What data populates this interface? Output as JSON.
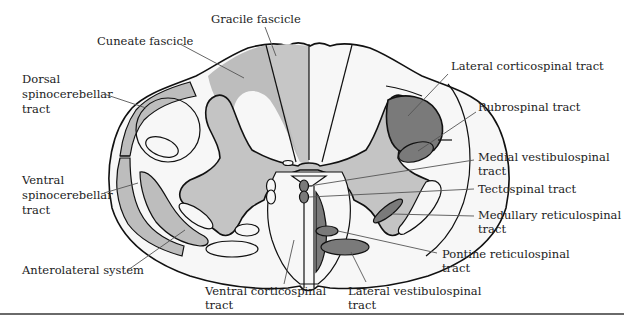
{
  "figure": {
    "colors": {
      "background": "#ffffff",
      "white_matter": "#f7f7f7",
      "light_gray_tract": "#bdbdbd",
      "gray_matter": "#c4c4c4",
      "dark_gray_tract": "#7a7a7a",
      "outline": "#111111",
      "leader_line": "#555555",
      "bottom_rule": "#6a6a6a"
    },
    "labels": {
      "gracile_fascicle": [
        "Gracile fascicle"
      ],
      "cuneate_fascicle": [
        "Cuneate fascicle"
      ],
      "dorsal_spinocerebellar": [
        "Dorsal",
        "spinocerebellar",
        "tract"
      ],
      "ventral_spinocerebellar": [
        "Ventral",
        "spinocerebellar",
        "tract"
      ],
      "anterolateral_system": [
        "Anterolateral system"
      ],
      "ventral_corticospinal": [
        "Ventral corticospinal",
        "tract"
      ],
      "lateral_vestibulospinal": [
        "Lateral vestibulospinal",
        "tract"
      ],
      "pontine_reticulospinal": [
        "Pontine reticulospinal",
        "tract"
      ],
      "medullary_reticulospinal": [
        "Medullary reticulospinal",
        "tract"
      ],
      "tectospinal": [
        "Tectospinal tract"
      ],
      "medial_vestibulospinal": [
        "Medial vestibulospinal",
        "tract"
      ],
      "rubrospinal": [
        "Rubrospinal tract"
      ],
      "lateral_corticospinal": [
        "Lateral corticospinal tract"
      ]
    }
  }
}
